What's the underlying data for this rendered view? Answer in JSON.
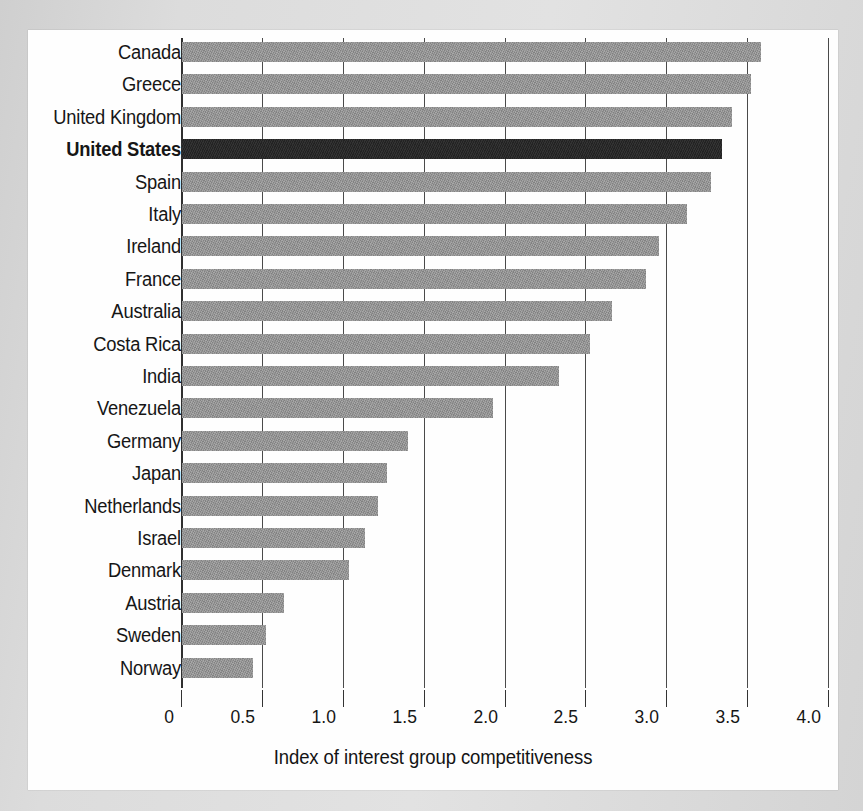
{
  "chart_data": {
    "type": "bar",
    "orientation": "horizontal",
    "title": "",
    "xlabel": "Index of interest group competitiveness",
    "ylabel": "",
    "xlim": [
      0,
      4.0
    ],
    "xticks": [
      "0",
      "0.5",
      "1.0",
      "1.5",
      "2.0",
      "2.5",
      "3.0",
      "3.5",
      "4.0"
    ],
    "xtick_values": [
      0,
      0.5,
      1.0,
      1.5,
      2.0,
      2.5,
      3.0,
      3.5,
      4.0
    ],
    "grid": "vertical",
    "legend": "none",
    "categories": [
      "Canada",
      "Greece",
      "United Kingdom",
      "United States",
      "Spain",
      "Italy",
      "Ireland",
      "France",
      "Australia",
      "Costa Rica",
      "India",
      "Venezuela",
      "Germany",
      "Japan",
      "Netherlands",
      "Israel",
      "Denmark",
      "Austria",
      "Sweden",
      "Norway"
    ],
    "values": [
      3.58,
      3.52,
      3.4,
      3.34,
      3.27,
      3.12,
      2.95,
      2.87,
      2.66,
      2.52,
      2.33,
      1.92,
      1.4,
      1.27,
      1.21,
      1.13,
      1.03,
      0.63,
      0.52,
      0.44
    ],
    "highlight_category": "United States",
    "colors": {
      "bar": "#8e8e8e",
      "bar_highlight": "#262626",
      "axis": "#333333",
      "gridline": "#4a4a4a",
      "plate_background": "#fefefe",
      "page_background": "#d9d9d9",
      "text": "#151515"
    }
  }
}
